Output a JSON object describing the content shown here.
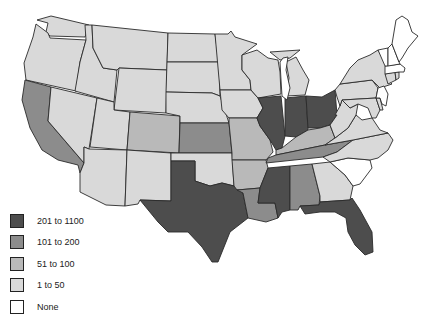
{
  "map": {
    "title": "",
    "region": "United States (lower 48)",
    "tiers": {
      "t5": {
        "label": "201 to 1100",
        "color": "#4d4d4d"
      },
      "t4": {
        "label": "101 to 200",
        "color": "#8c8c8c"
      },
      "t3": {
        "label": "51 to 100",
        "color": "#b9b9b9"
      },
      "t2": {
        "label": "1 to 50",
        "color": "#d9d9d9"
      },
      "t1": {
        "label": "None",
        "color": "#ffffff"
      }
    },
    "states": {
      "WA": "t2",
      "OR": "t2",
      "CA": "t4",
      "NV": "t2",
      "ID": "t2",
      "MT": "t2",
      "WY": "t2",
      "UT": "t2",
      "AZ": "t2",
      "CO": "t3",
      "NM": "t2",
      "ND": "t2",
      "SD": "t2",
      "NE": "t2",
      "KS": "t4",
      "OK": "t2",
      "TX": "t5",
      "MN": "t2",
      "IA": "t2",
      "MO": "t3",
      "AR": "t3",
      "LA": "t4",
      "WI": "t2",
      "IL": "t5",
      "MI": "t2",
      "IN": "t5",
      "OH": "t5",
      "KY": "t3",
      "TN": "t4",
      "MS": "t5",
      "AL": "t4",
      "GA": "t2",
      "FL": "t5",
      "SC": "t1",
      "NC": "t2",
      "VA": "t2",
      "WV": "t2",
      "PA": "t2",
      "NY": "t2",
      "MD": "t2",
      "DE": "t2",
      "NJ": "t1",
      "CT": "t2",
      "RI": "t2",
      "MA": "t1",
      "VT": "t1",
      "NH": "t1",
      "ME": "t1"
    }
  },
  "legend": {
    "items": [
      {
        "label": "201 to 1100",
        "color": "#4d4d4d"
      },
      {
        "label": "101 to 200",
        "color": "#8c8c8c"
      },
      {
        "label": "51 to 100",
        "color": "#b9b9b9"
      },
      {
        "label": "1 to 50",
        "color": "#d9d9d9"
      },
      {
        "label": "None",
        "color": "#ffffff"
      }
    ]
  }
}
